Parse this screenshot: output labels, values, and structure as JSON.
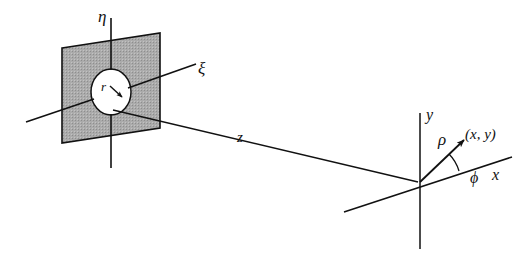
{
  "figure": {
    "colors": {
      "stroke": "#111111",
      "plane_fill": "#a9a9a9",
      "aperture_fill": "#ffffff",
      "background": "#ffffff"
    },
    "labels": {
      "eta": "η",
      "xi": "ξ",
      "aperture_radius": "r",
      "distance": "z",
      "y_axis": "y",
      "x_axis": "x",
      "rho": "ρ",
      "phi": "ϕ",
      "point": "(x, y)"
    },
    "elements": [
      {
        "name": "aperture-plane",
        "kind": "shaded-parallelogram"
      },
      {
        "name": "aperture-circle",
        "kind": "circle",
        "radius_label": "r"
      },
      {
        "name": "eta-axis",
        "kind": "axis",
        "label": "η"
      },
      {
        "name": "xi-axis",
        "kind": "axis",
        "label": "ξ"
      },
      {
        "name": "z-axis",
        "kind": "axis",
        "label": "z"
      },
      {
        "name": "x-axis",
        "kind": "axis",
        "label": "x"
      },
      {
        "name": "y-axis",
        "kind": "axis",
        "label": "y"
      },
      {
        "name": "rho-vector",
        "kind": "vector",
        "label": "ρ"
      },
      {
        "name": "phi-angle-arc",
        "kind": "arc",
        "label": "ϕ"
      },
      {
        "name": "observation-point",
        "kind": "point",
        "label": "(x, y)"
      }
    ]
  }
}
